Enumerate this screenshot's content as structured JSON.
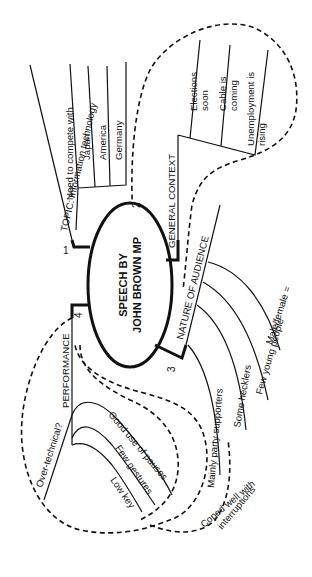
{
  "center": {
    "line1": "SPEECH BY",
    "line2": "JOHN BROWN MP"
  },
  "branches": [
    {
      "number": "1",
      "label": "TOPIC: Information technology",
      "sub": {
        "label": "Need to compete with",
        "items": [
          "Japan",
          "America",
          "Germany"
        ]
      }
    },
    {
      "number": "2",
      "label": "GENERAL CONTEXT",
      "items": [
        {
          "l1": "Elections",
          "l2": "soon"
        },
        {
          "l1": "Cable is",
          "l2": "coming"
        },
        {
          "l1": "Unemployment is",
          "l2": "rising"
        }
      ]
    },
    {
      "number": "3",
      "label": "NATURE OF AUDIENCE",
      "items": [
        "Male/female =",
        "Few young people",
        "Some hecklers",
        "Mainly party supporters"
      ]
    },
    {
      "number": "4",
      "label": "PERFORMANCE",
      "items": [
        "Over-technical?",
        "Good use of pauses",
        "Few gestures",
        "Low key"
      ]
    }
  ],
  "link_note": {
    "l1": "Coped well with",
    "l2": "interruptions"
  }
}
